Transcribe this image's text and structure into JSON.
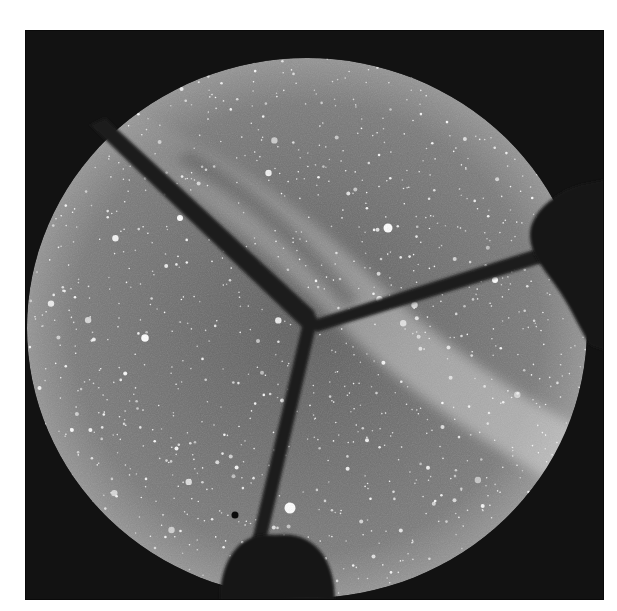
{
  "image": {
    "subject": "All-sky fisheye photograph of the night sky with the Milky Way",
    "tone": "grayscale",
    "colors": {
      "background_page": "#ffffff",
      "frame_dark": "#121212",
      "sky_base": "#6e6e6e",
      "milky_way_glow": "#b4b4b4",
      "spoke_dark": "#1c1c1c",
      "star": "#ffffff"
    },
    "elements": [
      "circular-sky-disk",
      "milky-way-band",
      "three-camera-support-spokes",
      "central-hub",
      "horizon-dome-obstruction-bottom",
      "horizon-obstruction-right",
      "star-field"
    ]
  }
}
